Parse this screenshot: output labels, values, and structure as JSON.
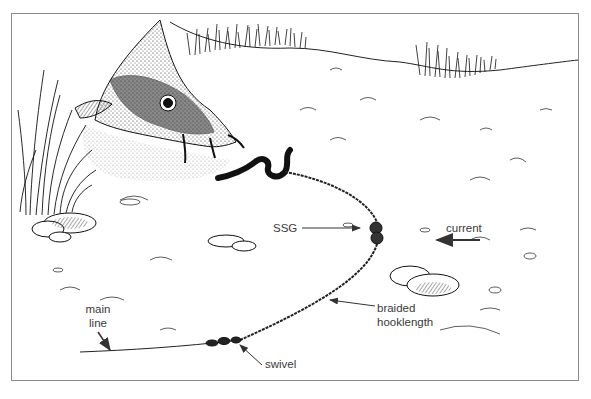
{
  "figure": {
    "labels": {
      "ssg": "SSG",
      "current": "current",
      "main_line_1": "main",
      "main_line_2": "line",
      "braided_1": "braided",
      "braided_2": "hooklength",
      "swivel": "swivel"
    },
    "colors": {
      "frame_border": "#8a8a8a",
      "ink": "#1a1a1a",
      "label_text": "#3a3a3a",
      "background": "#ffffff"
    }
  }
}
